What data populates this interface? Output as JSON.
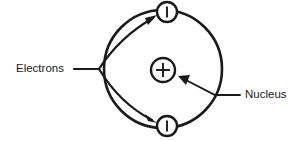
{
  "diagram": {
    "background_color": "#ffffff",
    "stroke_color": "#1a1a1a",
    "labels": {
      "electrons": "Electrons",
      "nucleus": "Nucleus"
    },
    "particles": {
      "nucleus_symbol": "+",
      "electron_symbol": "–",
      "electron_count": 2
    },
    "annotations": {
      "electrons_pointer_targets": 2,
      "nucleus_pointer_targets": 1
    }
  },
  "geometry": {
    "orbit": {
      "cx": 163,
      "cy": 69,
      "r": 59
    },
    "nucleus": {
      "cx": 163,
      "cy": 70,
      "r": 12
    },
    "electron_top": {
      "cx": 167,
      "cy": 12,
      "r": 10
    },
    "electron_bottom": {
      "cx": 167,
      "cy": 126,
      "r": 10
    },
    "electrons_label_pos": {
      "x": 16,
      "y": 69
    },
    "nucleus_label_pos": {
      "x": 245,
      "y": 95
    }
  }
}
